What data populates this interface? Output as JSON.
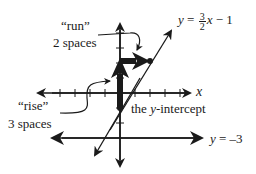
{
  "diagram": {
    "colors": {
      "ink": "#1a1a1a",
      "background": "#ffffff"
    },
    "labels": {
      "run_quote": "“run”",
      "run_desc": "2 spaces",
      "rise_quote": "“rise”",
      "rise_desc": "3 spaces",
      "y_intercept": "the y-intercept",
      "y_intercept_prefix": "the ",
      "y_intercept_var": "y",
      "y_intercept_suffix": "-intercept",
      "x_axis": "x",
      "line_eq_lhs": "y",
      "line_eq_equals": " = ",
      "line_eq_num": "3",
      "line_eq_den": "2",
      "line_eq_var": "x",
      "line_eq_rest": " − 1",
      "horiz_eq_lhs": "y",
      "horiz_eq_rest": " = –3"
    },
    "equations": {
      "sloped_line": "y = 3/2 x − 1",
      "horizontal_line": "y = −3"
    },
    "points": {
      "y_intercept": [
        0,
        -1
      ],
      "run_endpoint": [
        2,
        2
      ]
    },
    "slope": {
      "rise": 3,
      "run": 2
    }
  }
}
